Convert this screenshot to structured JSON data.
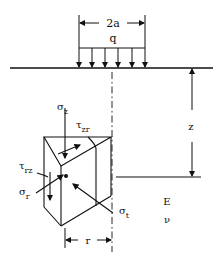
{
  "diagram": {
    "load": {
      "width_label": "2a",
      "intensity_label": "q"
    },
    "depth": {
      "label": "z"
    },
    "radius": {
      "label": "r"
    },
    "stresses": {
      "sigma_z": {
        "symbol": "σ",
        "sub": "z"
      },
      "tau_zr": {
        "symbol": "τ",
        "sub": "zr"
      },
      "tau_rz": {
        "symbol": "τ",
        "sub": "rz"
      },
      "sigma_r": {
        "symbol": "σ",
        "sub": "r"
      },
      "sigma_t": {
        "symbol": "σ",
        "sub": "t"
      }
    },
    "material": {
      "modulus": "E",
      "poisson": "ν"
    }
  }
}
